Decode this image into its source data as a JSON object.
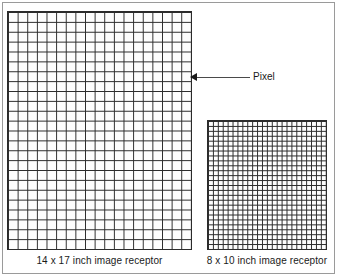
{
  "figure": {
    "width": 339,
    "height": 278,
    "background_color": "#ffffff",
    "border_color": "#9a9a9a",
    "grid_line_color": "#2b2b2b"
  },
  "receptors": [
    {
      "id": "large",
      "caption": "14 x 17 inch image receptor",
      "columns": 19,
      "rows": 24,
      "cell_size_px": 9.7,
      "x": 7,
      "y": 11,
      "width": 185,
      "height": 239
    },
    {
      "id": "small",
      "caption": "8 x 10 inch image receptor",
      "columns": 24,
      "rows": 26,
      "cell_size_px": 5,
      "x": 207,
      "y": 120,
      "width": 120,
      "height": 130
    }
  ],
  "callout": {
    "label": "Pixel",
    "points_to": "large",
    "arrow_direction": "left"
  }
}
